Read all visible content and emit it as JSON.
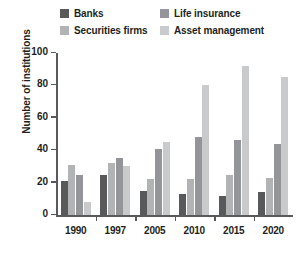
{
  "chart_data": {
    "type": "bar",
    "title": "",
    "subtitle": "",
    "xlabel": "",
    "ylabel": "Number of institutions",
    "categories": [
      "1990",
      "1997",
      "2005",
      "2010",
      "2015",
      "2020"
    ],
    "ylim": [
      0,
      100
    ],
    "yticks": [
      0,
      20,
      40,
      60,
      80,
      100
    ],
    "grid": false,
    "legend_position": "top",
    "series": [
      {
        "name": "Banks",
        "color": "#58595b",
        "values": [
          21,
          25,
          15,
          13,
          12,
          14
        ]
      },
      {
        "name": "Securities firms",
        "color": "#b2b3b5",
        "values": [
          31,
          32,
          22,
          22,
          25,
          23
        ]
      },
      {
        "name": "Life insurance",
        "color": "#939598",
        "values": [
          25,
          35,
          41,
          48,
          46,
          44
        ]
      },
      {
        "name": "Asset management",
        "color": "#c9cacb",
        "values": [
          8,
          30,
          45,
          80,
          92,
          85
        ]
      }
    ]
  }
}
